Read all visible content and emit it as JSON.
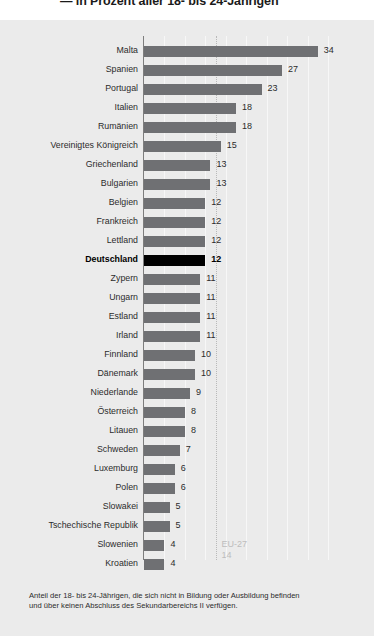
{
  "title": "— in Prozent aller 18- bis 24-Jährigen",
  "footnote": {
    "line1": "Anteil der 18- bis 24-Jährigen, die sich nicht in Bildung oder Ausbildung befinden",
    "line2": "und über keinen Abschluss des Sekundarbereichs II verfügen."
  },
  "reference": {
    "label": "EU-27",
    "value": "14"
  },
  "colors": {
    "panel_bg": "#ebebeb",
    "bar": "#6f7073",
    "bar_highlight": "#000000",
    "gridline": "#f7f7f7",
    "axis": "#7d7d7d",
    "reference_line": "#b9b9b9",
    "reference_text": "#bdbdbd"
  },
  "chart_data": {
    "type": "bar",
    "orientation": "horizontal",
    "title": "— in Prozent aller 18- bis 24-Jährigen",
    "xlabel": "",
    "ylabel": "",
    "xlim": [
      0,
      36
    ],
    "grid": true,
    "legend": null,
    "highlight_category": "Deutschland",
    "reference_line": {
      "label": "EU-27",
      "value": 14
    },
    "annotation": "Anteil der 18- bis 24-Jährigen, die sich nicht in Bildung oder Ausbildung befinden und über keinen Abschluss des Sekundarbereichs II verfügen.",
    "categories": [
      "Malta",
      "Spanien",
      "Portugal",
      "Italien",
      "Rumänien",
      "Vereinigtes Königreich",
      "Griechenland",
      "Bulgarien",
      "Belgien",
      "Frankreich",
      "Lettland",
      "Deutschland",
      "Zypern",
      "Ungarn",
      "Estland",
      "Irland",
      "Finnland",
      "Dänemark",
      "Niederlande",
      "Österreich",
      "Litauen",
      "Schweden",
      "Luxemburg",
      "Polen",
      "Slowakei",
      "Tschechische Republik",
      "Slowenien",
      "Kroatien"
    ],
    "values": [
      34,
      27,
      23,
      18,
      18,
      15,
      13,
      13,
      12,
      12,
      12,
      12,
      11,
      11,
      11,
      11,
      10,
      10,
      9,
      8,
      8,
      7,
      6,
      6,
      5,
      5,
      4,
      4
    ]
  }
}
